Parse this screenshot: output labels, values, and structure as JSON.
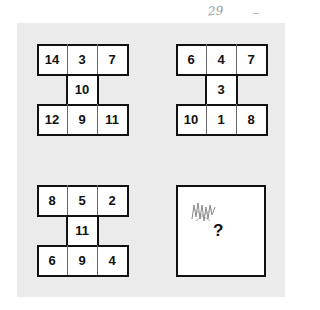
{
  "annotation": {
    "handwritten_note": "29",
    "dash": "-"
  },
  "puzzles": [
    {
      "top": [
        "14",
        "3",
        "7"
      ],
      "middle": "10",
      "bottom": [
        "12",
        "9",
        "11"
      ]
    },
    {
      "top": [
        "6",
        "4",
        "7"
      ],
      "middle": "3",
      "bottom": [
        "10",
        "1",
        "8"
      ]
    },
    {
      "top": [
        "8",
        "5",
        "2"
      ],
      "middle": "11",
      "bottom": [
        "6",
        "9",
        "4"
      ]
    }
  ],
  "answer_box": {
    "symbol": "?",
    "scribble": "handwritten scribble"
  },
  "colors": {
    "panel": "#ebebeb",
    "border": "#111111",
    "cell": "#ffffff"
  }
}
